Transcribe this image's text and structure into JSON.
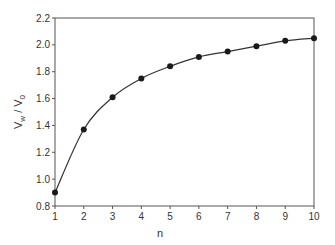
{
  "chart_data": {
    "type": "line",
    "title": "",
    "xlabel": "n",
    "ylabel": "V_w / V_0",
    "ylabel_parts": {
      "v1": "V",
      "s1": "w",
      "slash": " / ",
      "v2": "V",
      "s2": "0"
    },
    "x": [
      1,
      2,
      3,
      4,
      5,
      6,
      7,
      8,
      9,
      10
    ],
    "series": [
      {
        "name": "Vw/V0",
        "values": [
          0.9,
          1.37,
          1.61,
          1.75,
          1.84,
          1.91,
          1.95,
          1.99,
          2.03,
          2.05
        ]
      }
    ],
    "xlim": [
      1,
      10
    ],
    "ylim": [
      0.8,
      2.2
    ],
    "xticks": [
      "1",
      "2",
      "3",
      "4",
      "5",
      "6",
      "7",
      "8",
      "9",
      "10"
    ],
    "yticks": [
      "0.8",
      "1.0",
      "1.2",
      "1.4",
      "1.6",
      "1.8",
      "2.0",
      "2.2"
    ],
    "grid": false,
    "legend": null,
    "markers": "filled-circle",
    "colors": {
      "line": "#333333",
      "marker": "#1a1a1a",
      "axis": "#555555"
    }
  }
}
